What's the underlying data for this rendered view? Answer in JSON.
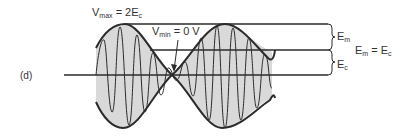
{
  "figure": {
    "panel_label": "(d)",
    "vmax": {
      "symbol": "V",
      "sub": "max",
      "rest": " = 2E",
      "rest_sub": "c"
    },
    "vmin": {
      "symbol": "V",
      "sub": "min",
      "rest": " = 0 V"
    },
    "brace_upper": {
      "symbol": "E",
      "sub": "m"
    },
    "brace_lower": {
      "symbol": "E",
      "sub": "c"
    },
    "equality": {
      "lhs": "E",
      "lhs_sub": "m",
      "eq": " = ",
      "rhs": "E",
      "rhs_sub": "c"
    }
  },
  "colors": {
    "line": "#2b2b2b",
    "fill": "#d9d9d9",
    "background": "#ffffff"
  }
}
